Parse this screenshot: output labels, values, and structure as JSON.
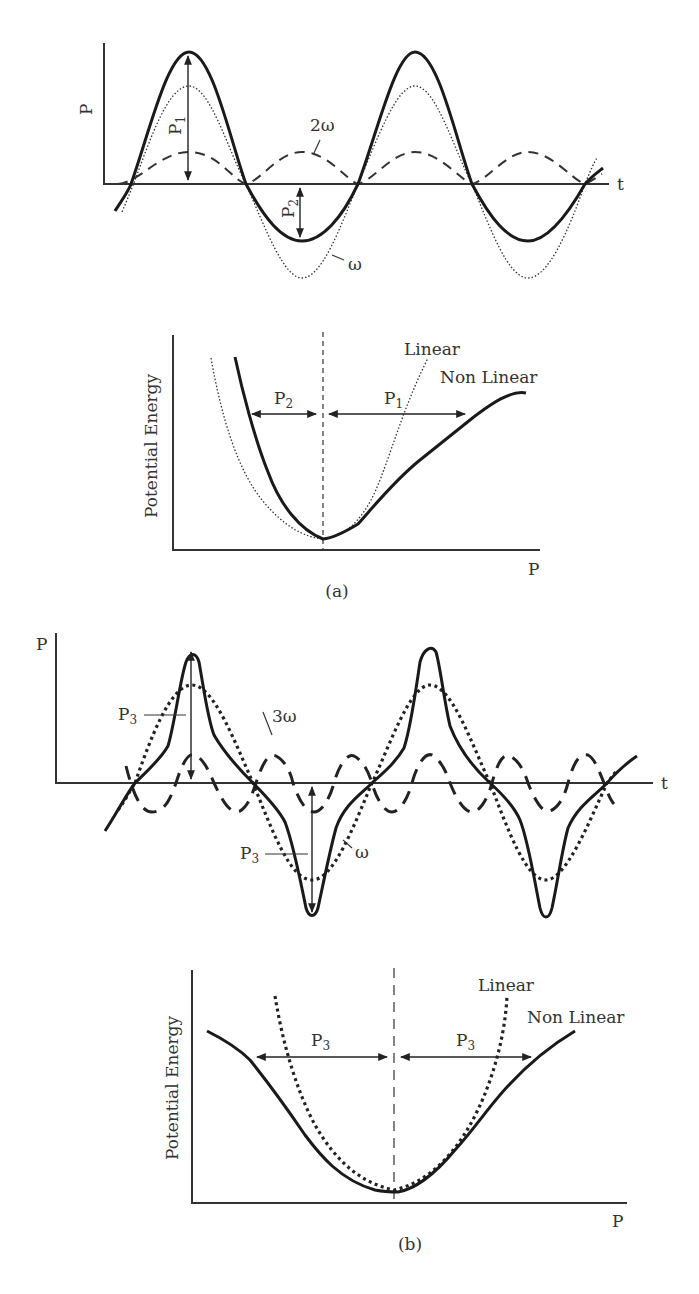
{
  "figure": {
    "panel_a": {
      "caption": "(a)",
      "time_plot": {
        "y_axis_label": "P",
        "x_axis_label": "t",
        "annotations": {
          "p1": "P",
          "p1_sub": "1",
          "p2": "P",
          "p2_sub": "2",
          "omega": "ω",
          "two_omega": "2ω"
        }
      },
      "energy_plot": {
        "y_axis_label": "Potential Energy",
        "x_axis_label": "P",
        "legend_linear": "Linear",
        "legend_nonlinear": "Non Linear",
        "annotations": {
          "p2": "P",
          "p2_sub": "2",
          "p1": "P",
          "p1_sub": "1"
        }
      }
    },
    "panel_b": {
      "caption": "(b)",
      "time_plot": {
        "y_axis_label": "P",
        "x_axis_label": "t",
        "annotations": {
          "p3_top": "P",
          "p3_top_sub": "3",
          "p3_bottom": "P",
          "p3_bottom_sub": "3",
          "omega": "ω",
          "three_omega": "3ω"
        }
      },
      "energy_plot": {
        "y_axis_label": "Potential Energy",
        "x_axis_label": "P",
        "legend_linear": "Linear",
        "legend_nonlinear": "Non Linear",
        "annotations": {
          "p3_left": "P",
          "p3_left_sub": "3",
          "p3_right": "P",
          "p3_right_sub": "3"
        }
      }
    }
  },
  "colors": {
    "ink": "#1a1a1a",
    "background": "#ffffff"
  }
}
